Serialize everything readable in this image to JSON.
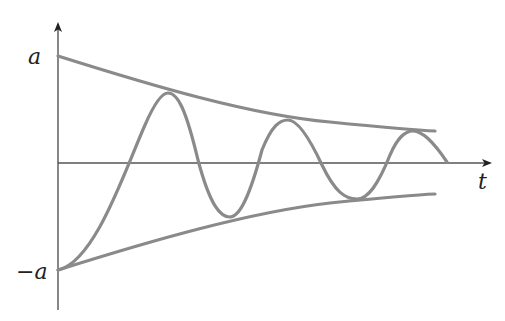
{
  "diagram": {
    "type": "damped-oscillation",
    "labels": {
      "y_max": "a",
      "y_min": "−a",
      "x_axis": "t"
    },
    "colors": {
      "curve": "#8a8a8a",
      "axes": "#555555",
      "text": "#222222",
      "background": "#ffffff"
    },
    "axes": {
      "origin": [
        58,
        163
      ],
      "y_axis_top": 22,
      "y_axis_bottom": 310,
      "x_axis_right": 490
    },
    "upper_envelope": "M58,56 C150,85 250,115 330,122 C380,127 410,130 435,131",
    "lower_envelope": "M58,270 C150,241 250,212 330,203 C380,198 410,195 435,194",
    "oscillation": "M58,270 C95,262 125,170 145,125 C155,102 162,93 168,93 C178,93 186,110 198,160 C210,205 220,217 230,217 C240,217 250,195 262,150 C272,125 280,120 288,120 C297,120 308,135 322,165 C335,192 345,199 357,199 C368,199 378,185 390,155 C398,137 405,131 413,131 C422,131 432,140 447,162"
  }
}
